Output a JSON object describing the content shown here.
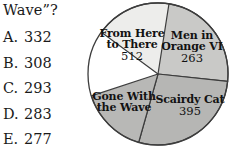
{
  "question": {
    "stem": "Wave”?",
    "choices": [
      {
        "letter": "A.",
        "value": "332"
      },
      {
        "letter": "B.",
        "value": "308"
      },
      {
        "letter": "C.",
        "value": "293"
      },
      {
        "letter": "D.",
        "value": "283"
      },
      {
        "letter": "E.",
        "value": "277"
      }
    ]
  },
  "chart_data": {
    "type": "pie",
    "title": "",
    "categories": [
      "From Here to There",
      "Men in Orange VI",
      "Scairdy Cat",
      "Gone With the Wave"
    ],
    "values": [
      512,
      263,
      395,
      null
    ],
    "legend": "none",
    "slices": [
      {
        "name_line1": "From Here",
        "name_line2": "to There",
        "value": "512",
        "color": "#ededeb",
        "start_angle": 306,
        "end_angle": 72
      },
      {
        "name_line1": "Men in",
        "name_line2": "Orange VI",
        "value": "263",
        "color": "#c9c9c7",
        "start_angle": 9,
        "end_angle": 96
      },
      {
        "name_line1": "Scairdy Cat",
        "name_line2": "",
        "value": "395",
        "color": "#b6b6b4",
        "start_angle": 96,
        "end_angle": 196
      },
      {
        "name_line1": "Gone With",
        "name_line2": "the Wave",
        "value": "",
        "color": "#b8b8b6",
        "start_angle": 196,
        "end_angle": 252
      }
    ],
    "outline_color": "#3d3d3d"
  }
}
